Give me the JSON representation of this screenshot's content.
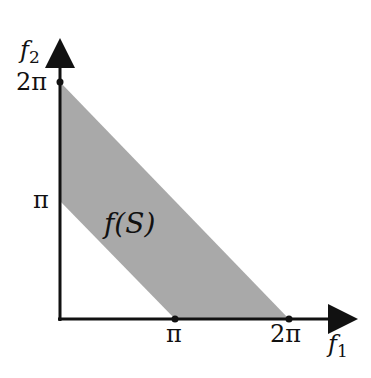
{
  "diagram": {
    "region_label": "f(S)",
    "region_color": "#a9a9a9",
    "axis_color": "#111111",
    "x_axis": {
      "label": "f",
      "label_sub": "1",
      "ticks": [
        "π",
        "2π"
      ]
    },
    "y_axis": {
      "label": "f",
      "label_sub": "2",
      "ticks": [
        "π",
        "2π"
      ]
    },
    "polygon_vertices": [
      {
        "f1": 0,
        "f2": "2π"
      },
      {
        "f1": "2π",
        "f2": 0
      },
      {
        "f1": "π",
        "f2": 0
      },
      {
        "f1": 0,
        "f2": "π"
      }
    ]
  }
}
